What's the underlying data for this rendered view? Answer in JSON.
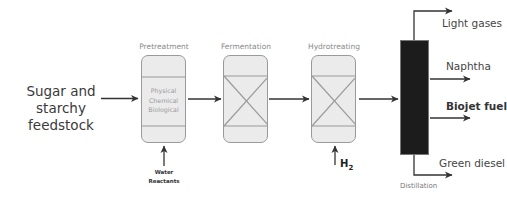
{
  "feedstock": {
    "line1": "Sugar and",
    "line2": "starchy feedstock"
  },
  "stages": [
    {
      "label": "Pretreatment",
      "inner": [
        "Physical",
        "Chemical",
        "Biological"
      ],
      "input": [
        "Water",
        "Reactants"
      ]
    },
    {
      "label": "Fermentation"
    },
    {
      "label": "Hydrotreating",
      "input_symbol": "H",
      "input_subscript": "2"
    }
  ],
  "distillation": {
    "label": "Distillation",
    "outputs": [
      {
        "label": "Light gases",
        "bold": false
      },
      {
        "label": "Naphtha",
        "bold": false
      },
      {
        "label": "Biojet fuel",
        "bold": true
      },
      {
        "label": "Green diesel",
        "bold": false
      }
    ]
  },
  "colors": {
    "box_fill": "#ebebeb",
    "box_border": "#9a9a9a",
    "arrow": "#333333",
    "column": "#1c1c1c"
  }
}
